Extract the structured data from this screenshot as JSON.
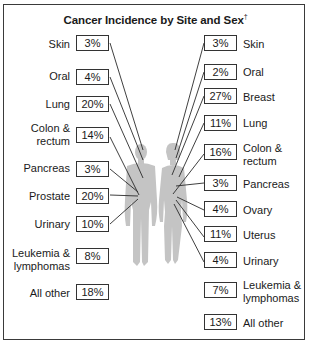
{
  "title": "Cancer Incidence by Site and Sex",
  "title_mark": "†",
  "male": {
    "items": [
      {
        "site": "Skin",
        "pct": "3%"
      },
      {
        "site": "Oral",
        "pct": "4%"
      },
      {
        "site": "Lung",
        "pct": "20%"
      },
      {
        "site": "Colon & rectum",
        "pct": "14%"
      },
      {
        "site": "Pancreas",
        "pct": "3%"
      },
      {
        "site": "Prostate",
        "pct": "20%"
      },
      {
        "site": "Urinary",
        "pct": "10%"
      },
      {
        "site": "Leukemia & lymphomas",
        "pct": "8%"
      },
      {
        "site": "All other",
        "pct": "18%"
      }
    ]
  },
  "female": {
    "items": [
      {
        "site": "Skin",
        "pct": "3%"
      },
      {
        "site": "Oral",
        "pct": "2%"
      },
      {
        "site": "Breast",
        "pct": "27%"
      },
      {
        "site": "Lung",
        "pct": "11%"
      },
      {
        "site": "Colon & rectum",
        "pct": "16%"
      },
      {
        "site": "Pancreas",
        "pct": "3%"
      },
      {
        "site": "Ovary",
        "pct": "4%"
      },
      {
        "site": "Uterus",
        "pct": "11%"
      },
      {
        "site": "Urinary",
        "pct": "4%"
      },
      {
        "site": "Leukemia & lymphomas",
        "pct": "7%"
      },
      {
        "site": "All other",
        "pct": "13%"
      }
    ]
  },
  "labels": {
    "male": {
      "skin": "Skin",
      "oral": "Oral",
      "lung": "Lung",
      "colon1": "Colon &",
      "colon2": "rectum",
      "pancreas": "Pancreas",
      "prostate": "Prostate",
      "urinary": "Urinary",
      "leuk1": "Leukemia &",
      "leuk2": "lymphomas",
      "other": "All other"
    },
    "female": {
      "skin": "Skin",
      "oral": "Oral",
      "breast": "Breast",
      "lung": "Lung",
      "colon1": "Colon &",
      "colon2": "rectum",
      "pancreas": "Pancreas",
      "ovary": "Ovary",
      "uterus": "Uterus",
      "urinary": "Urinary",
      "leuk1": "Leukemia &",
      "leuk2": "lymphomas",
      "other": "All other"
    }
  },
  "colors": {
    "figure": "#c4c4c4",
    "line": "#2a2a2a",
    "border": "#333333"
  }
}
